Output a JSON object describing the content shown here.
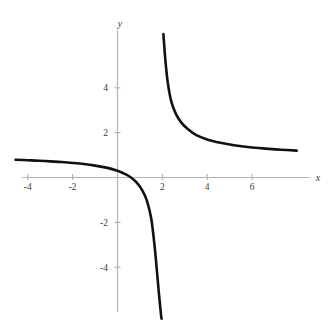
{
  "chart_data": {
    "type": "line",
    "title": "",
    "subtitle": "",
    "xlabel": "x",
    "ylabel": "y",
    "xlim": [
      -4.6,
      8.1
    ],
    "ylim": [
      -6.3,
      6.5
    ],
    "xticks": [
      -4,
      -2,
      2,
      4,
      6
    ],
    "yticks": [
      -4,
      -2,
      2,
      4
    ],
    "xtick_labels": [
      "-4",
      "-2",
      "2",
      "4",
      "6"
    ],
    "ytick_labels": [
      "-4",
      "-2",
      "2",
      "4"
    ],
    "grid": false,
    "legend": null,
    "annotations": [],
    "axis_color": "#b4b4b4",
    "curve_color": "#111111",
    "background_color": "#ffffff",
    "asymptotes": {
      "vertical_x": 2.0,
      "horizontal_y": 1.0
    },
    "intercepts": {
      "x_intercept": 0.6,
      "y_intercept": 0.3
    },
    "series": [
      {
        "name": "left-branch",
        "comment": "branch for x < 2, approaches y=1 from below as x decreases, plunges to -infinity as x approaches 2 from the left",
        "x": [
          -4.55,
          -4.0,
          -3.5,
          -3.0,
          -2.5,
          -2.0,
          -1.5,
          -1.0,
          -0.5,
          0.0,
          0.35,
          0.6,
          0.85,
          1.1,
          1.3,
          1.5,
          1.65,
          1.78,
          1.86,
          1.92,
          1.95,
          1.97
        ],
        "y": [
          0.79,
          0.77,
          0.75,
          0.72,
          0.69,
          0.65,
          0.6,
          0.53,
          0.44,
          0.3,
          0.15,
          0.0,
          -0.22,
          -0.56,
          -1.0,
          -1.8,
          -3.0,
          -4.4,
          -5.3,
          -5.9,
          -6.2,
          -6.3
        ]
      },
      {
        "name": "right-branch",
        "comment": "branch for x > 2, descends from +infinity near x=2 and approaches y=1 from above",
        "x": [
          2.05,
          2.1,
          2.15,
          2.25,
          2.4,
          2.6,
          2.85,
          3.15,
          3.5,
          4.0,
          4.6,
          5.2,
          5.9,
          6.6,
          7.3,
          8.0
        ],
        "y": [
          6.4,
          5.7,
          5.1,
          4.2,
          3.4,
          2.85,
          2.45,
          2.15,
          1.9,
          1.7,
          1.55,
          1.44,
          1.35,
          1.29,
          1.24,
          1.2
        ]
      }
    ]
  }
}
